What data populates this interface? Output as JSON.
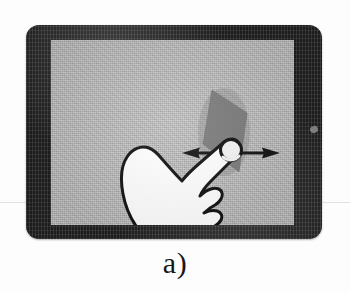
{
  "figure": {
    "caption": "a)",
    "caption_name": "subfigure-label-a"
  },
  "device": {
    "type": "tablet",
    "orientation": "landscape",
    "bezel_color": "#1d1d1d",
    "screen_color": "#b2b2b2",
    "port_mark": "side-port"
  },
  "gesture": {
    "name": "horizontal-swipe",
    "hand": {
      "label": "pointing-hand",
      "fill_color": "#ffffff",
      "outline_color": "#111111"
    },
    "touch_point": {
      "label": "fingertip-touch-circle",
      "fill_color": "#f4f4f4",
      "outline_color": "#101010",
      "x": 205,
      "y": 125
    },
    "arrow": {
      "label": "double-headed-horizontal-arrow",
      "direction": "bidirectional-horizontal",
      "color": "#121212",
      "start_x": 157,
      "end_x": 252,
      "y": 128
    },
    "target_shape": {
      "label": "dark-rhombus-object",
      "color": "#6f6f6f",
      "shape": "rhombus"
    }
  }
}
